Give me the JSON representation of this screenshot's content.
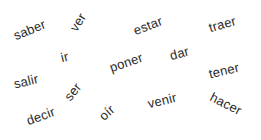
{
  "canvas": {
    "width": 261,
    "height": 140,
    "background": "#ffffff",
    "text_color": "#2b2b2b"
  },
  "word_cloud": {
    "title": "",
    "description": "Scattered Spanish infinitive verbs at varying rotations",
    "words": [
      {
        "text": "saber",
        "x": 14,
        "y": 36,
        "rotation": -22,
        "size": 13
      },
      {
        "text": "ver",
        "x": 73,
        "y": 30,
        "rotation": -58,
        "size": 13
      },
      {
        "text": "estar",
        "x": 134,
        "y": 31,
        "rotation": -21,
        "size": 13
      },
      {
        "text": "traer",
        "x": 209,
        "y": 28,
        "rotation": -16,
        "size": 13
      },
      {
        "text": "ir",
        "x": 61,
        "y": 58,
        "rotation": -14,
        "size": 13
      },
      {
        "text": "poner",
        "x": 110,
        "y": 68,
        "rotation": -19,
        "size": 13
      },
      {
        "text": "dar",
        "x": 170,
        "y": 56,
        "rotation": -16,
        "size": 13
      },
      {
        "text": "tener",
        "x": 209,
        "y": 74,
        "rotation": -13,
        "size": 13
      },
      {
        "text": "salir",
        "x": 14,
        "y": 84,
        "rotation": -13,
        "size": 13
      },
      {
        "text": "ser",
        "x": 67,
        "y": 99,
        "rotation": -52,
        "size": 13
      },
      {
        "text": "decir",
        "x": 27,
        "y": 121,
        "rotation": -20,
        "size": 13
      },
      {
        "text": "oír",
        "x": 101,
        "y": 118,
        "rotation": -42,
        "size": 13
      },
      {
        "text": "venir",
        "x": 148,
        "y": 104,
        "rotation": -14,
        "size": 13
      },
      {
        "text": "hacer",
        "x": 211,
        "y": 96,
        "rotation": 27,
        "size": 13
      }
    ]
  }
}
